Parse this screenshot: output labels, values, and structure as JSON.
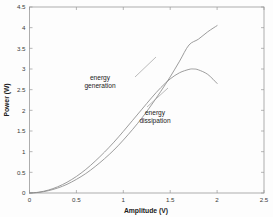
{
  "chart_data": {
    "type": "line",
    "title": "",
    "xlabel": "Amplitude (V)",
    "ylabel": "Power (W)",
    "xlim": [
      0,
      2.5
    ],
    "ylim": [
      0,
      4.5
    ],
    "xticks": [
      "0",
      "0.5",
      "1",
      "1.5",
      "2",
      "2.5"
    ],
    "xtick_values": [
      0,
      0.5,
      1,
      1.5,
      2,
      2.5
    ],
    "yticks": [
      "0",
      "0.5",
      "1",
      "1.5",
      "2",
      "2.5",
      "3",
      "3.5",
      "4",
      "4.5"
    ],
    "ytick_values": [
      0,
      0.5,
      1,
      1.5,
      2,
      2.5,
      3,
      3.5,
      4,
      4.5
    ],
    "grid": false,
    "legend_position": "inline-annotations",
    "series": [
      {
        "name": "energy generation",
        "color": "#8b8b8b",
        "x": [
          0,
          0.1,
          0.2,
          0.3,
          0.4,
          0.5,
          0.6,
          0.7,
          0.8,
          0.9,
          1.0,
          1.1,
          1.2,
          1.3,
          1.4,
          1.5,
          1.6,
          1.7,
          1.8,
          1.9,
          2.0
        ],
        "y": [
          0,
          0.015,
          0.055,
          0.12,
          0.21,
          0.33,
          0.47,
          0.64,
          0.83,
          1.04,
          1.28,
          1.54,
          1.82,
          2.13,
          2.46,
          2.81,
          3.19,
          3.58,
          3.72,
          3.9,
          4.05
        ]
      },
      {
        "name": "energy dissipation",
        "color": "#8b8b8b",
        "x": [
          0,
          0.1,
          0.2,
          0.3,
          0.4,
          0.5,
          0.6,
          0.7,
          0.8,
          0.9,
          1.0,
          1.1,
          1.2,
          1.3,
          1.4,
          1.5,
          1.6,
          1.7,
          1.75,
          1.8,
          1.9,
          2.0
        ],
        "y": [
          0,
          0.02,
          0.07,
          0.15,
          0.26,
          0.4,
          0.57,
          0.77,
          0.99,
          1.23,
          1.49,
          1.76,
          2.03,
          2.3,
          2.55,
          2.76,
          2.91,
          2.99,
          3.0,
          2.98,
          2.87,
          2.65
        ]
      }
    ],
    "annotations": [
      {
        "text_lines": [
          "energy",
          "generation"
        ],
        "x_px": 100,
        "y_px": 80
      },
      {
        "text_lines": [
          "energy",
          "dissipation"
        ],
        "x_px": 155,
        "y_px": 115
      }
    ]
  },
  "colors": {
    "background": "#fdfdfd",
    "axis": "#9a9a9a",
    "curve": "#8b8b8b",
    "text": "#202020"
  }
}
